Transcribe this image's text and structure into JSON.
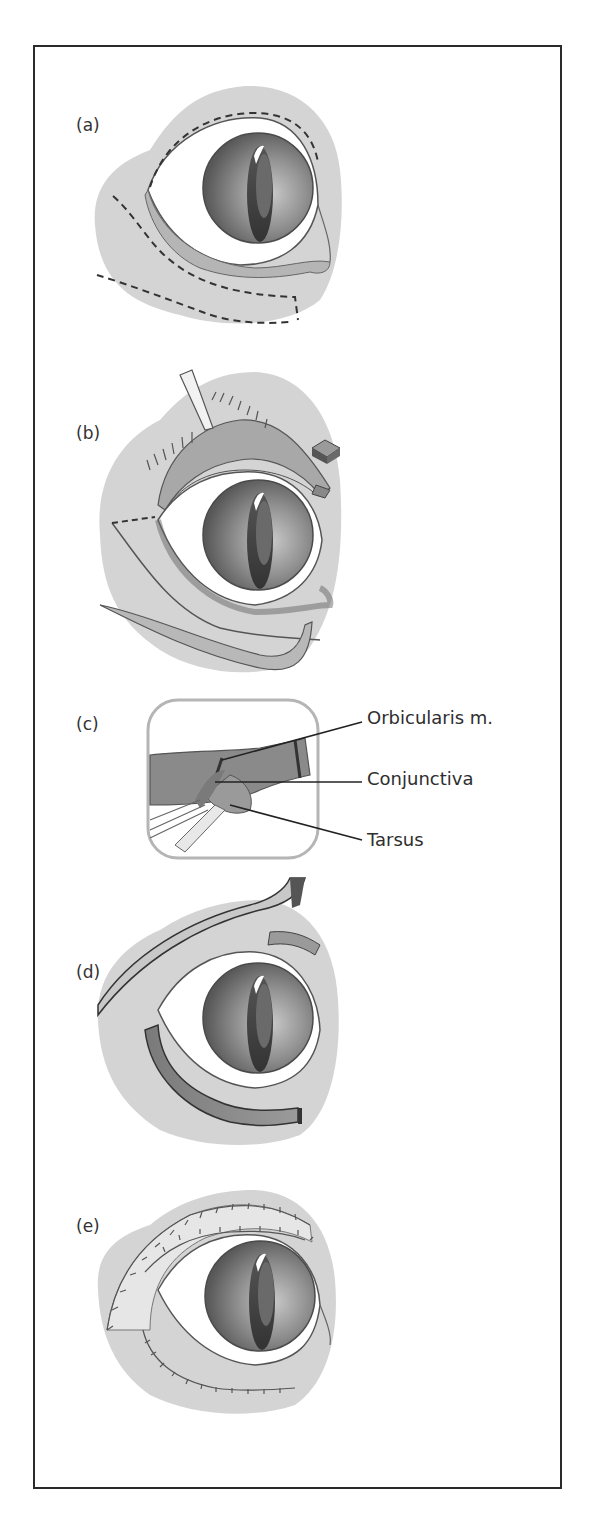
{
  "figure": {
    "panels": [
      {
        "id": "a",
        "label": "(a)"
      },
      {
        "id": "b",
        "label": "(b)"
      },
      {
        "id": "c",
        "label": "(c)"
      },
      {
        "id": "d",
        "label": "(d)"
      },
      {
        "id": "e",
        "label": "(e)"
      }
    ],
    "callouts": [
      {
        "text": "Orbicularis m."
      },
      {
        "text": "Conjunctiva"
      },
      {
        "text": "Tarsus"
      }
    ],
    "colors": {
      "skin": "#d4d4d4",
      "skin_dark": "#bdbdbd",
      "sclera": "#ffffff",
      "iris_outer": "#6a6a6a",
      "iris_inner": "#b8b8b8",
      "pupil": "#3c3c3c",
      "outline": "#444444",
      "frame": "#2a2a2a",
      "muscle": "#8c8c8c",
      "muscle_dark": "#6e6e6e"
    }
  }
}
